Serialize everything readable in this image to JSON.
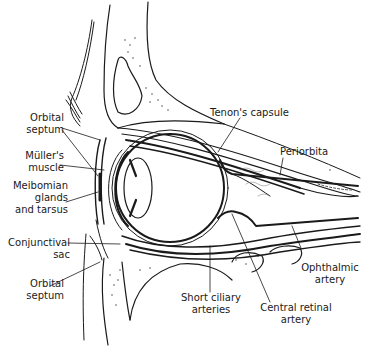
{
  "diagram": {
    "colors": {
      "ink": "#1a1a1a",
      "background": "#ffffff",
      "stipple": "#555555"
    },
    "labels": {
      "orbital_septum_upper": [
        "Orbital",
        "septum"
      ],
      "mullers_muscle": [
        "Müller's",
        "muscle"
      ],
      "meibomian": [
        "Meibomian",
        "glands",
        "and tarsus"
      ],
      "conjunctival_sac": [
        "Conjunctival",
        "sac"
      ],
      "orbital_septum_lower": [
        "Orbital",
        "septum"
      ],
      "tenons_capsule": "Tenon's capsule",
      "periorbita": "Periorbita",
      "ophthalmic_artery": [
        "Ophthalmic",
        "artery"
      ],
      "short_ciliary_arteries": [
        "Short ciliary",
        "arteries"
      ],
      "central_retinal_artery": [
        "Central retinal",
        "artery"
      ]
    }
  }
}
